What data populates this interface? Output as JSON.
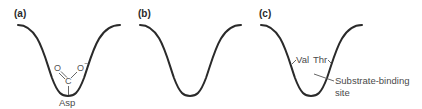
{
  "panels": [
    {
      "label": "(a)",
      "description": "Pocket with aspartate carboxylate at bottom",
      "residue": {
        "name": "Asp",
        "atoms": {
          "oxygen_left": "O",
          "oxygen_right": "O",
          "charge": "−",
          "carbon": "C"
        }
      }
    },
    {
      "label": "(b)",
      "description": "Empty deep pocket"
    },
    {
      "label": "(c)",
      "description": "Pocket lined by Val and Thr",
      "residues": [
        "Val",
        "Thr"
      ],
      "callout": {
        "line1": "Substrate-binding",
        "line2": "site"
      }
    }
  ],
  "colors": {
    "curve": "#2a2a2a",
    "text": "#4a4a4a",
    "background": "#ffffff"
  }
}
